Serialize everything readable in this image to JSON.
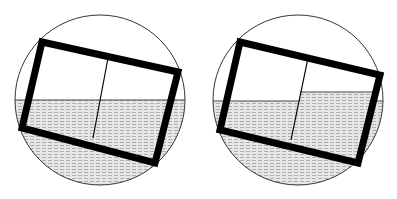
{
  "figure": {
    "width": 397,
    "height": 199,
    "colors": {
      "background": "#ffffff",
      "outline": "#000000",
      "water_fill": "#d9d9d9",
      "water_hatch": "#9a9a9a",
      "circle_stroke": "#333333"
    },
    "panels": [
      {
        "id": "left",
        "description": "Tilted two-compartment box floating in water; both compartments open to the same water level",
        "circle": {
          "cx": 100,
          "cy": 100,
          "r": 85
        },
        "water_level_y": 100,
        "box": {
          "points": "42,42 178,72 155,163 22,128",
          "stroke_width": 7
        },
        "divider": {
          "x1": 108,
          "y1": 58,
          "x2": 93,
          "y2": 138
        },
        "inner_water": []
      },
      {
        "id": "right",
        "description": "Tilted two-compartment box floating in water; right compartment holds water at a higher level",
        "circle": {
          "cx": 298,
          "cy": 100,
          "r": 85
        },
        "water_level_y": 101,
        "box": {
          "points": "240,42 380,75 358,163 220,130",
          "stroke_width": 7
        },
        "divider": {
          "x1": 308,
          "y1": 58,
          "x2": 291,
          "y2": 140
        },
        "inner_water": [
          {
            "compartment": "right",
            "level_y": 92
          }
        ]
      }
    ]
  }
}
